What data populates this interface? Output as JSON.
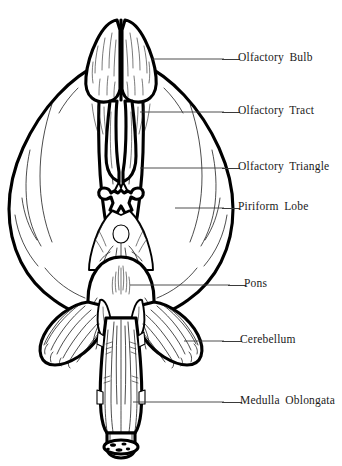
{
  "figure": {
    "view": "ventral",
    "background_color": "#ffffff",
    "ink_color": "#000000",
    "leader_line_color": "#3a3a3a",
    "style": "line drawing with hatching"
  },
  "labels": [
    {
      "id": "olfactory-bulb",
      "text": "Olfactory Bulb",
      "text_x": 238,
      "text_y": 52,
      "leader_x": 222,
      "leader_y": 59,
      "leader_width": 18
    },
    {
      "id": "olfactory-tract",
      "text": "Olfactory Tract",
      "text_x": 238,
      "text_y": 105,
      "leader_x": 222,
      "leader_y": 112,
      "leader_width": 18
    },
    {
      "id": "olfactory-triangle",
      "text": "Olfactory Triangle",
      "text_x": 238,
      "text_y": 161,
      "leader_x": 222,
      "leader_y": 168,
      "leader_width": 18
    },
    {
      "id": "piriform-lobe",
      "text": "Piriform Lobe",
      "text_x": 238,
      "text_y": 201,
      "leader_x": 222,
      "leader_y": 208,
      "leader_width": 18
    },
    {
      "id": "pons",
      "text": "Pons",
      "text_x": 244,
      "text_y": 278,
      "leader_x": 228,
      "leader_y": 285,
      "leader_width": 18
    },
    {
      "id": "cerebellum",
      "text": "Cerebellum",
      "text_x": 240,
      "text_y": 334,
      "leader_x": 222,
      "leader_y": 341,
      "leader_width": 20
    },
    {
      "id": "medulla-oblongata",
      "text": "Medulla Oblongata",
      "text_x": 240,
      "text_y": 395,
      "leader_x": 222,
      "leader_y": 402,
      "leader_width": 20
    }
  ],
  "structures": [
    {
      "id": "olfactory-bulb-left",
      "name": "Left olfactory bulb"
    },
    {
      "id": "olfactory-bulb-right",
      "name": "Right olfactory bulb"
    },
    {
      "id": "olfactory-tract-left",
      "name": "Left olfactory tract"
    },
    {
      "id": "olfactory-tract-right",
      "name": "Right olfactory tract"
    },
    {
      "id": "olfactory-triangle",
      "name": "Olfactory triangle"
    },
    {
      "id": "piriform-lobe-left",
      "name": "Left piriform lobe"
    },
    {
      "id": "piriform-lobe-right",
      "name": "Right piriform lobe"
    },
    {
      "id": "optic-chiasm",
      "name": "Optic chiasm"
    },
    {
      "id": "cerebral-peduncles",
      "name": "Cerebral peduncles"
    },
    {
      "id": "pons",
      "name": "Pons"
    },
    {
      "id": "cerebellum-left",
      "name": "Left cerebellar hemisphere"
    },
    {
      "id": "cerebellum-right",
      "name": "Right cerebellar hemisphere"
    },
    {
      "id": "medulla-oblongata",
      "name": "Medulla oblongata"
    },
    {
      "id": "spinal-cord-stump",
      "name": "Spinal cord stump"
    }
  ]
}
